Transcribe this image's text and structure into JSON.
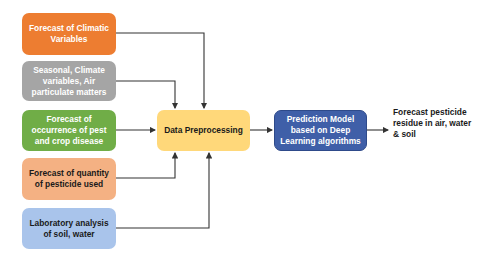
{
  "diagram": {
    "inputs": [
      {
        "label": "Forecast of Climatic Variables",
        "color": "#ED7D31"
      },
      {
        "label": "Seasonal, Climate variables, Air particulate matters",
        "color": "#A5A5A5"
      },
      {
        "label": "Forecast of occurrence of pest and crop disease",
        "color": "#70AD47"
      },
      {
        "label": "Forecast of quantity of pesticide used",
        "color": "#F4B183"
      },
      {
        "label": "Laboratory analysis of soil, water",
        "color": "#A9C4EB"
      }
    ],
    "preprocessing": {
      "label": "Data Preprocessing",
      "color": "#FFD87A"
    },
    "model": {
      "label": "Prediction Model based on Deep Learning algorithms",
      "color": "#3F5FA8"
    },
    "output": {
      "label": "Forecast pesticide residue in air, water & soil"
    }
  }
}
